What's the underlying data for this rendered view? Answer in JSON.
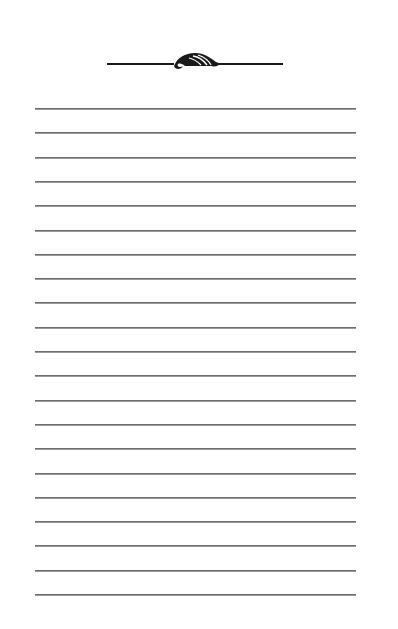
{
  "page": {
    "type": "blank lined notepad page",
    "background_color": "#ffffff",
    "line_color": "#6e6e6e",
    "ornament_color": "#1a1a1a"
  },
  "header": {
    "ornament_icon": "leaf-flourish-icon"
  },
  "lines": {
    "count": 21,
    "first_y": 108,
    "spacing": 24.3,
    "left": 35,
    "width": 321
  }
}
